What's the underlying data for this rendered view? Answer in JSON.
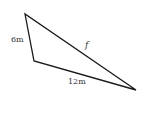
{
  "diagram": {
    "type": "triangle",
    "vertices": {
      "top": [
        25,
        14
      ],
      "bottom_left": [
        34,
        61
      ],
      "right": [
        136,
        90
      ]
    },
    "stroke_color": "#1a1a1a",
    "sides": [
      {
        "name": "left",
        "label": "6m"
      },
      {
        "name": "hypotenuse",
        "label": "f"
      },
      {
        "name": "bottom",
        "label": "12m"
      }
    ]
  }
}
